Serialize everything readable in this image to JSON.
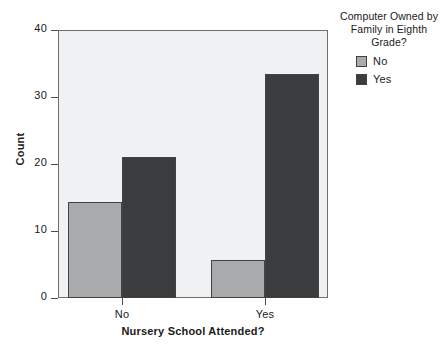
{
  "chart_data": {
    "type": "bar",
    "title": "",
    "subtitle": "",
    "xlabel": "Nursery School Attended?",
    "ylabel": "Count",
    "categories": [
      "No",
      "Yes"
    ],
    "series": [
      {
        "name": "No",
        "values": [
          15,
          6
        ],
        "color": "#a9aaab"
      },
      {
        "name": "Yes",
        "values": [
          22,
          35
        ],
        "color": "#3a3c3d"
      }
    ],
    "ylim": [
      0,
      41.8
    ],
    "yticks": [
      0,
      10,
      20,
      30,
      40
    ],
    "ytick_labels": [
      "0",
      "10",
      "20",
      "30",
      "40"
    ],
    "xtick_labels": [
      "No",
      "Yes"
    ],
    "grid": false,
    "legend_position": "right",
    "legend_title": "Computer Owned by Family in Eighth Grade?",
    "legend_title_lines": [
      "Computer Owned by",
      "Family in Eighth",
      "Grade?"
    ],
    "panel_background": "#eff1f2",
    "panel_border": "#6d6f70"
  },
  "legend": {
    "title_line_1": "Computer Owned by",
    "title_line_2": "Family in Eighth",
    "title_line_3": "Grade?",
    "entries": [
      {
        "label": "No"
      },
      {
        "label": "Yes"
      }
    ]
  },
  "axes": {
    "y_label": "Count",
    "x_label": "Nursery School Attended?",
    "y_ticks": [
      "40",
      "30",
      "20",
      "10",
      "0"
    ],
    "x_ticks": [
      "No",
      "Yes"
    ]
  }
}
